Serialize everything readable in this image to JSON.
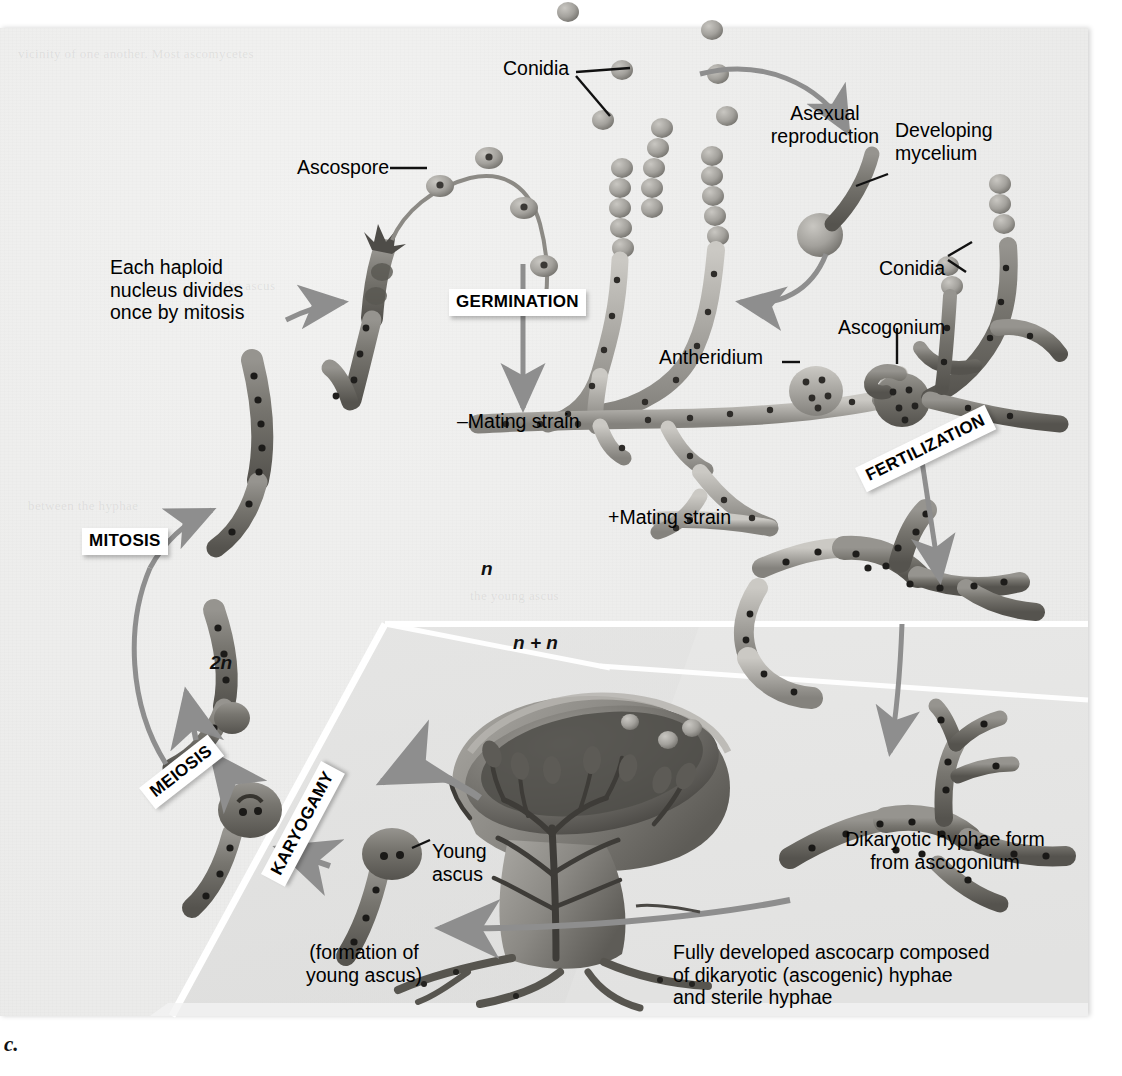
{
  "figure": {
    "caption": "c."
  },
  "ploidy_zones": [
    {
      "id": "haploid",
      "label": "n",
      "region": "upper-left"
    },
    {
      "id": "dikaryotic",
      "label": "n + n",
      "region": "lower-right band"
    },
    {
      "id": "diploid",
      "label": "2n",
      "region": "lower-left wedge"
    }
  ],
  "stage_badges": [
    {
      "id": "germination",
      "label": "GERMINATION",
      "rotated": false
    },
    {
      "id": "fertilization",
      "label": "FERTILIZATION",
      "rotated": true
    },
    {
      "id": "mitosis",
      "label": "MITOSIS",
      "rotated": false
    },
    {
      "id": "meiosis",
      "label": "MEIOSIS",
      "rotated": true
    },
    {
      "id": "karyogamy",
      "label": "KARYOGAMY",
      "rotated": true
    }
  ],
  "labels": [
    {
      "id": "conidia-top",
      "text": "Conidia"
    },
    {
      "id": "ascospore",
      "text": "Ascospore"
    },
    {
      "id": "asexual-reproduction",
      "text": "Asexual\nreproduction"
    },
    {
      "id": "developing-mycelium",
      "text": "Developing\nmycelium"
    },
    {
      "id": "conidia-right",
      "text": "Conidia"
    },
    {
      "id": "haploid-nucleus-note",
      "text": "Each haploid\nnucleus divides\nonce by mitosis"
    },
    {
      "id": "ascogonium",
      "text": "Ascogonium"
    },
    {
      "id": "antheridium",
      "text": "Antheridium"
    },
    {
      "id": "minus-mating-strain",
      "text": "–Mating strain"
    },
    {
      "id": "plus-mating-strain",
      "text": "+Mating strain"
    },
    {
      "id": "young-ascus",
      "text": "Young\nascus"
    },
    {
      "id": "formation-young-ascus",
      "text": "(formation of\nyoung ascus)"
    },
    {
      "id": "dikaryotic-hyphae",
      "text": "Dikaryotic hyphae form\nfrom ascogonium"
    },
    {
      "id": "ascocarp",
      "text": "Fully developed ascocarp composed\nof dikaryotic (ascogenic) hyphae\nand sterile hyphae"
    }
  ],
  "colors": {
    "background": "#ededec",
    "shaded_zone": "#e0e0df",
    "divider": "#ffffff",
    "arrow": "#8e8e8e",
    "hypha_light": "#b9b7b2",
    "hypha_dark": "#6e6c68",
    "text": "#000000",
    "badge_bg": "#ffffff"
  },
  "ghost_text": [
    "vicinity of one another. Most ascomycetes",
    "and have used a rich",
    "spreading it",
    "between the hyphae",
    "and give rise to",
    "forming a diploid",
    "in the ascus",
    "haploid nuclei",
    "a process of",
    "the young ascus",
    "ascocarp structure",
    "are released as",
    "sterile hyphae",
    "(Ascomycota)"
  ]
}
